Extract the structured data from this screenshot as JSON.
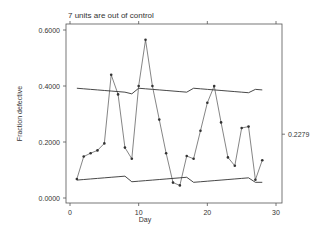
{
  "chart_data": {
    "type": "line",
    "title": "7 units are out of control",
    "xlabel": "Day",
    "ylabel": "Fraction defective",
    "xlim": [
      0,
      30
    ],
    "ylim": [
      0,
      0.6
    ],
    "x_ticks": [
      "0",
      "10",
      "20",
      "30"
    ],
    "y_ticks": [
      "0.0000",
      "0.2000",
      "0.4000",
      "0.6000"
    ],
    "center_line_label": "0.2279",
    "center_line": 0.2279,
    "grid": false,
    "legend": null,
    "x": [
      1,
      2,
      3,
      4,
      5,
      6,
      7,
      8,
      9,
      10,
      11,
      12,
      13,
      14,
      15,
      16,
      17,
      18,
      19,
      20,
      21,
      22,
      23,
      24,
      25,
      26,
      27,
      28
    ],
    "series": [
      {
        "name": "Fraction defective",
        "values": [
          0.068,
          0.148,
          0.16,
          0.17,
          0.195,
          0.44,
          0.37,
          0.18,
          0.14,
          0.4,
          0.565,
          0.4,
          0.28,
          0.16,
          0.055,
          0.045,
          0.15,
          0.14,
          0.24,
          0.34,
          0.4,
          0.27,
          0.145,
          0.115,
          0.25,
          0.255,
          0.065,
          0.135
        ]
      },
      {
        "name": "Upper control limit",
        "values": [
          0.392,
          0.39,
          0.388,
          0.386,
          0.384,
          0.382,
          0.38,
          0.378,
          0.372,
          0.392,
          0.39,
          0.388,
          0.386,
          0.384,
          0.382,
          0.38,
          0.378,
          0.392,
          0.39,
          0.388,
          0.386,
          0.384,
          0.382,
          0.38,
          0.378,
          0.376,
          0.388,
          0.386
        ]
      },
      {
        "name": "Lower control limit",
        "values": [
          0.064,
          0.066,
          0.068,
          0.07,
          0.072,
          0.074,
          0.076,
          0.078,
          0.058,
          0.06,
          0.062,
          0.064,
          0.066,
          0.068,
          0.07,
          0.072,
          0.074,
          0.056,
          0.058,
          0.06,
          0.062,
          0.064,
          0.066,
          0.068,
          0.07,
          0.072,
          0.056,
          0.056
        ]
      }
    ]
  }
}
